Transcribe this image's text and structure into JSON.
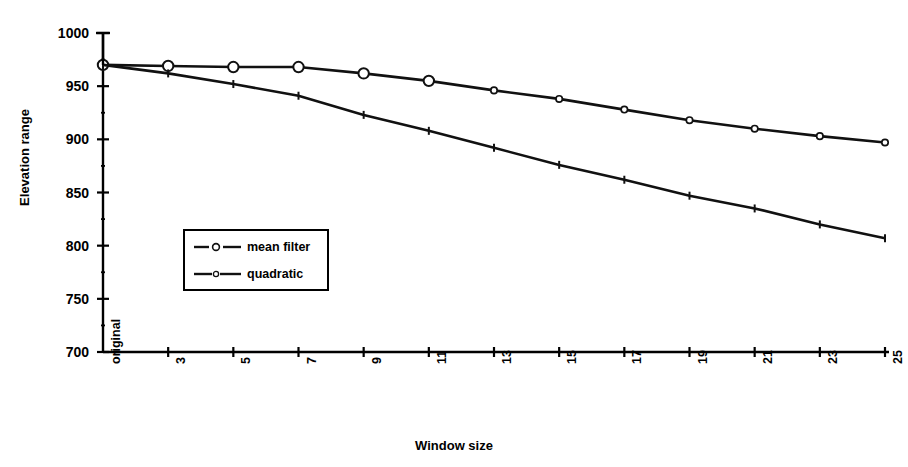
{
  "chart_data": {
    "type": "line",
    "title": "",
    "xlabel": "Window size",
    "ylabel": "Elevation range",
    "categories": [
      "original",
      "3",
      "5",
      "7",
      "9",
      "11",
      "13",
      "15",
      "17",
      "19",
      "21",
      "23",
      "25"
    ],
    "ylim": [
      700,
      1000
    ],
    "yticks": [
      700,
      750,
      800,
      850,
      900,
      950,
      1000
    ],
    "yticks_labels": [
      "700",
      "750",
      "800",
      "850",
      "900",
      "950",
      "1000"
    ],
    "grid": false,
    "legend_position": "inside-left-lower",
    "series": [
      {
        "name": "mean filter",
        "marker": "open-circle",
        "values": [
          970,
          969,
          968,
          968,
          962,
          955,
          946,
          938,
          928,
          918,
          910,
          903,
          897
        ]
      },
      {
        "name": "quadratic",
        "marker": "small-tick",
        "values": [
          970,
          962,
          952,
          941,
          923,
          908,
          892,
          876,
          862,
          847,
          835,
          820,
          807
        ]
      }
    ],
    "annotations": [
      {
        "name": "error-bar-original",
        "x": "original",
        "low": 970,
        "high": 1000
      }
    ]
  },
  "axes": {
    "y_axis_title": "Elevation range",
    "x_axis_title": "Window size"
  },
  "legend": {
    "items": [
      {
        "label": "mean filter"
      },
      {
        "label": "quadratic"
      }
    ]
  },
  "colors": {
    "line": "#111111",
    "background": "#ffffff",
    "axis": "#000000"
  }
}
